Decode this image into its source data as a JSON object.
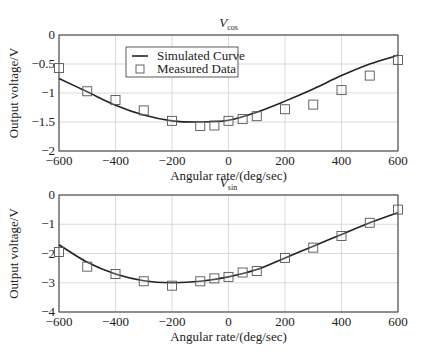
{
  "chart_data": [
    {
      "type": "line",
      "title": "V_cos",
      "title_main": "V",
      "title_sub": "cos",
      "xlabel": "Angular rate/(deg/sec)",
      "ylabel": "Output voltage/V",
      "xlim": [
        -600,
        600
      ],
      "ylim": [
        -2,
        0
      ],
      "xticks": [
        "-600",
        "-400",
        "-200",
        "0",
        "200",
        "400",
        "600"
      ],
      "yticks": [
        "0",
        "-0.5",
        "-1",
        "-1.5",
        "-2"
      ],
      "grid": true,
      "legend": {
        "position": "upper-left-center",
        "entries": [
          "Simulated Curve",
          "Measured Data"
        ]
      },
      "series": [
        {
          "name": "Simulated Curve",
          "style": "line",
          "x": [
            -600,
            -500,
            -400,
            -300,
            -200,
            -100,
            0,
            100,
            200,
            300,
            400,
            500,
            600
          ],
          "y": [
            -0.75,
            -0.98,
            -1.21,
            -1.38,
            -1.48,
            -1.5,
            -1.47,
            -1.33,
            -1.14,
            -0.93,
            -0.7,
            -0.5,
            -0.35
          ]
        },
        {
          "name": "Measured Data",
          "style": "square-markers",
          "x": [
            -600,
            -500,
            -400,
            -300,
            -200,
            -100,
            -50,
            0,
            50,
            100,
            200,
            300,
            400,
            500,
            600
          ],
          "y": [
            -0.57,
            -0.97,
            -1.12,
            -1.3,
            -1.48,
            -1.57,
            -1.56,
            -1.48,
            -1.45,
            -1.4,
            -1.28,
            -1.2,
            -0.95,
            -0.7,
            -0.43
          ]
        }
      ]
    },
    {
      "type": "line",
      "title": "V_sin",
      "title_main": "V",
      "title_sub": "sin",
      "xlabel": "Angular rate/(deg/sec)",
      "ylabel": "Output voltage/V",
      "xlim": [
        -600,
        600
      ],
      "ylim": [
        -4,
        0
      ],
      "xticks": [
        "-600",
        "-400",
        "-200",
        "0",
        "200",
        "400",
        "600"
      ],
      "yticks": [
        "0",
        "-1",
        "-2",
        "-3",
        "-4"
      ],
      "grid": true,
      "series": [
        {
          "name": "Simulated Curve",
          "style": "line",
          "x": [
            -600,
            -500,
            -400,
            -300,
            -200,
            -100,
            0,
            100,
            200,
            300,
            400,
            500,
            600
          ],
          "y": [
            -1.7,
            -2.3,
            -2.7,
            -2.93,
            -3.0,
            -2.95,
            -2.8,
            -2.55,
            -2.15,
            -1.75,
            -1.35,
            -0.95,
            -0.6
          ]
        },
        {
          "name": "Measured Data",
          "style": "square-markers",
          "x": [
            -600,
            -500,
            -400,
            -300,
            -200,
            -100,
            -50,
            0,
            50,
            100,
            200,
            300,
            400,
            500,
            600
          ],
          "y": [
            -1.95,
            -2.45,
            -2.7,
            -2.95,
            -3.1,
            -2.95,
            -2.85,
            -2.8,
            -2.65,
            -2.6,
            -2.15,
            -1.8,
            -1.4,
            -0.95,
            -0.5
          ]
        }
      ]
    }
  ],
  "footer_text": "Fig. ..."
}
